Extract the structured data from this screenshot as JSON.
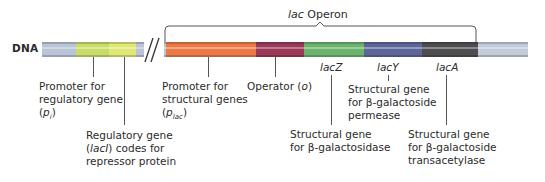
{
  "diagram": {
    "title": "lac Operon",
    "title_italic_part": "lac",
    "title_rest": " Operon",
    "dna_label": "DNA",
    "break_symbol": "//",
    "segments": [
      {
        "name": "dna-left",
        "x": 42,
        "w": 34,
        "color": "#b9c4d6"
      },
      {
        "name": "promoter-regulatory",
        "x": 76,
        "w": 33,
        "color": "#c8dc6a"
      },
      {
        "name": "regulatory-gene",
        "x": 109,
        "w": 27,
        "color": "#dfe874"
      },
      {
        "name": "dna-mid",
        "x": 136,
        "w": 30,
        "color": "#b9c4d6"
      },
      {
        "name": "promoter-structural",
        "x": 166,
        "w": 90,
        "color": "#ec7a48"
      },
      {
        "name": "operator",
        "x": 256,
        "w": 48,
        "color": "#9a3a58"
      },
      {
        "name": "lacZ",
        "x": 304,
        "w": 60,
        "color": "#6ab46e"
      },
      {
        "name": "lacY",
        "x": 364,
        "w": 58,
        "color": "#5e6699"
      },
      {
        "name": "lacA",
        "x": 422,
        "w": 56,
        "color": "#4e4e50"
      },
      {
        "name": "dna-right",
        "x": 478,
        "w": 50,
        "color": "#c2cbd9"
      }
    ],
    "labels": {
      "promoter_regulatory": {
        "line1": "Promoter for",
        "line2": "regulatory gene",
        "line3_pre": "(",
        "line3_italic": "p",
        "line3_sub": "i",
        "line3_post": ")"
      },
      "regulatory_gene": {
        "line1": "Regulatory gene",
        "line2_pre": "(",
        "line2_italic": "lacI",
        "line2_post": ") codes for",
        "line3": "repressor protein"
      },
      "promoter_structural": {
        "line1": "Promoter for",
        "line2": "structural genes",
        "line3_pre": "(",
        "line3_italic": "p",
        "line3_sub": "lac",
        "line3_post": ")"
      },
      "operator": {
        "pre": "Operator (",
        "italic": "o",
        "post": ")"
      },
      "lacZ": {
        "tag_italic": "lac",
        "tag_gene": "Z",
        "line1": "Structural gene",
        "line2": "for β-galactosidase"
      },
      "lacY": {
        "tag_italic": "lac",
        "tag_gene": "Y",
        "line1": "Structural gene",
        "line2": "for β-galactoside",
        "line3": "permease"
      },
      "lacA": {
        "tag_italic": "lac",
        "tag_gene": "A",
        "line1": "Structural gene",
        "line2": "for β-galactoside",
        "line3": "transacetylase"
      }
    }
  }
}
